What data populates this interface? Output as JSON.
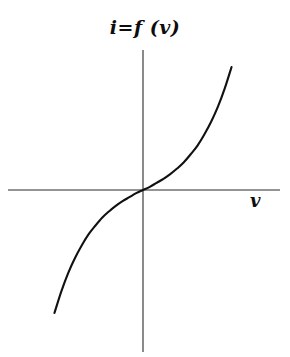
{
  "figure": {
    "title": "i=f (v)",
    "background_color": "#ffffff",
    "width": 290,
    "height": 357
  },
  "axes": {
    "x_label": "v",
    "y_label": "i",
    "axis_color": "#2b2b2b",
    "origin": {
      "x": 143,
      "y": 190
    },
    "x_axis": {
      "x_start": 8,
      "x_end": 280,
      "y": 190
    },
    "y_axis": {
      "x": 143,
      "y_start": 50,
      "y_end": 352
    }
  },
  "chart_data": {
    "type": "line",
    "title": "i=f (v)",
    "xlabel": "v",
    "ylabel": "i",
    "grid": false,
    "legend": null,
    "axis_style": "cartesian-cross-through-origin",
    "tick_labels": {
      "x": [],
      "y": []
    },
    "xlim": [
      -1.3,
      1.6
    ],
    "ylim": [
      -1.6,
      1.6
    ],
    "series": [
      {
        "name": "i=f (v)",
        "color": "#111111",
        "line_width": 2.1,
        "description": "monotonically increasing odd-symmetric S-shaped (cubic-like) characteristic passing through the origin",
        "x": [
          -1.3,
          -1.2,
          -1.1,
          -1.0,
          -0.9,
          -0.8,
          -0.7,
          -0.6,
          -0.5,
          -0.4,
          -0.3,
          -0.2,
          -0.1,
          0.0,
          0.1,
          0.2,
          0.3,
          0.4,
          0.5,
          0.6,
          0.7,
          0.8,
          0.9,
          1.0,
          1.1,
          1.2,
          1.3
        ],
        "y": [
          -1.55,
          -1.28,
          -1.05,
          -0.86,
          -0.7,
          -0.56,
          -0.45,
          -0.35,
          -0.27,
          -0.2,
          -0.14,
          -0.09,
          -0.04,
          0.0,
          0.04,
          0.09,
          0.14,
          0.2,
          0.27,
          0.35,
          0.45,
          0.56,
          0.7,
          0.86,
          1.05,
          1.28,
          1.55
        ]
      }
    ],
    "annotations": [
      {
        "text": "i=f (v)",
        "role": "curve-equation-title",
        "position": "top-center"
      },
      {
        "text": "v",
        "role": "x-axis-name",
        "position": "axis-right-below"
      }
    ]
  },
  "curve_path": "M 38 327 C 55 308 70 288 84 268 C 97 249 108 232 118 219 C 126 208 134 199 143 190 C 152 181 160 172 168 161 C 178 148 189 131 202 112 C 215 93 233 74 252 63"
}
